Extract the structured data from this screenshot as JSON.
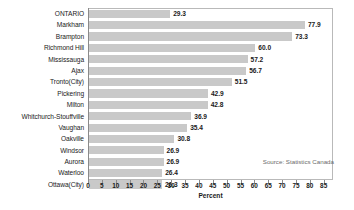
{
  "chart_data": {
    "type": "bar",
    "orientation": "horizontal",
    "title": "",
    "xlabel": "Percent",
    "ylabel": "",
    "xlim": [
      0,
      88
    ],
    "xticks": [
      0,
      5,
      10,
      15,
      20,
      25,
      30,
      35,
      40,
      45,
      50,
      55,
      60,
      65,
      70,
      75,
      80,
      85
    ],
    "grid": false,
    "legend": null,
    "bar_color": "#c9c9c9",
    "categories": [
      "ONTARIO",
      "Markham",
      "Brampton",
      "Richmond Hill",
      "Mississauga",
      "Ajax",
      "Tronto(City)",
      "Pickering",
      "Milton",
      "Whitchurch-Stouffville",
      "Vaughan",
      "Oakville",
      "Windsor",
      "Aurora",
      "Waterloo",
      "Ottawa(City)"
    ],
    "values": [
      29.3,
      77.9,
      73.3,
      60.0,
      57.2,
      56.7,
      51.5,
      42.9,
      42.8,
      36.9,
      35.4,
      30.8,
      26.9,
      26.9,
      26.4,
      26.3
    ],
    "value_labels": [
      "29.3",
      "77.9",
      "73.3",
      "60.0",
      "57.2",
      "56.7",
      "51.5",
      "42.9",
      "42.8",
      "36.9",
      "35.4",
      "30.8",
      "26.9",
      "26.9",
      "26.4",
      "26.3"
    ],
    "annotations": [
      {
        "text": "Source: Statistics Canada"
      }
    ]
  },
  "source": {
    "note": "Source: Statistics Canada"
  }
}
